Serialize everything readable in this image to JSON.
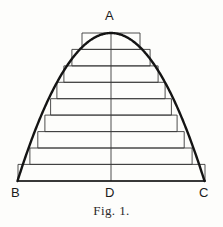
{
  "figure": {
    "caption": "Fig. 1.",
    "background_color": "#fdfdfb",
    "ink_color": "#1a1a1a",
    "rect_stroke_color": "#3a3a3a",
    "curve_stroke_color": "#141414",
    "curve_stroke_width": 2.4,
    "rect_stroke_width": 0.9,
    "axis_stroke_width": 0.9
  },
  "labels": {
    "apex": "A",
    "base_left": "B",
    "base_center": "D",
    "base_right": "C"
  },
  "chart_data": {
    "type": "area",
    "title": "Fig. 1.",
    "subtitle": "",
    "xlabel": "",
    "ylabel": "",
    "grid": false,
    "legend": null,
    "geometry": {
      "apex_point": {
        "label": "A",
        "x": 111,
        "y": 33
      },
      "base_left_point": {
        "label": "B",
        "x": 18,
        "y": 181
      },
      "base_right_point": {
        "label": "C",
        "x": 205,
        "y": 181
      },
      "base_midpoint": {
        "label": "D",
        "x": 111,
        "y": 181
      },
      "base_width": 187,
      "height": 148,
      "axis_of_symmetry_x": 111
    },
    "curve": {
      "kind": "parabola",
      "vertex_x": 111,
      "vertex_y": 33,
      "base_y": 181,
      "half_span": 93.5,
      "equation": "y = base_y - height * (1 - ((x - vertex_x)/half_span)^2)"
    },
    "rectangles": {
      "count": 9,
      "step_height": 16.44,
      "note": "Each rectangle spans from the baseline-relative level to the next, with half-width taken from the parabola at the rectangle's top edge (inscribed).",
      "items": [
        {
          "index": 1,
          "top_y": 33.0,
          "bottom_y": 49.4,
          "left_x": 82.0,
          "right_x": 140.0,
          "width": 58.0
        },
        {
          "index": 2,
          "top_y": 49.4,
          "bottom_y": 65.9,
          "left_x": 71.9,
          "right_x": 150.1,
          "width": 78.2
        },
        {
          "index": 3,
          "top_y": 65.9,
          "bottom_y": 82.3,
          "left_x": 63.9,
          "right_x": 158.1,
          "width": 94.2
        },
        {
          "index": 4,
          "top_y": 82.3,
          "bottom_y": 98.7,
          "left_x": 56.9,
          "right_x": 165.1,
          "width": 108.2
        },
        {
          "index": 5,
          "top_y": 98.7,
          "bottom_y": 115.1,
          "left_x": 50.6,
          "right_x": 171.4,
          "width": 120.8
        },
        {
          "index": 6,
          "top_y": 115.1,
          "bottom_y": 131.6,
          "left_x": 44.9,
          "right_x": 177.1,
          "width": 132.2
        },
        {
          "index": 7,
          "top_y": 131.6,
          "bottom_y": 148.0,
          "left_x": 37.8,
          "right_x": 184.2,
          "width": 146.4
        },
        {
          "index": 8,
          "top_y": 148.0,
          "bottom_y": 164.4,
          "left_x": 29.9,
          "right_x": 192.1,
          "width": 162.2
        },
        {
          "index": 9,
          "top_y": 164.4,
          "bottom_y": 181.0,
          "left_x": 18.0,
          "right_x": 205.0,
          "width": 187.0
        }
      ]
    }
  }
}
